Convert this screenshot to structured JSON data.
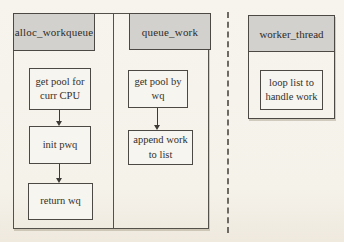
{
  "diagram_title": "workqueue flow diagram",
  "colors": {
    "paper_background": "#f6f3ec",
    "header_fill": "#d3d1cd",
    "border": "#4c4843",
    "text": "#33302b"
  },
  "columns": [
    {
      "header": "alloc_workqueue",
      "steps": [
        "get pool for\ncurr CPU",
        "init pwq",
        "return wq"
      ]
    },
    {
      "header": "queue_work",
      "steps": [
        "get pool by\nwq",
        "append work\nto list"
      ]
    },
    {
      "header": "worker_thread",
      "steps": [
        "loop list to\nhandle work"
      ]
    }
  ]
}
